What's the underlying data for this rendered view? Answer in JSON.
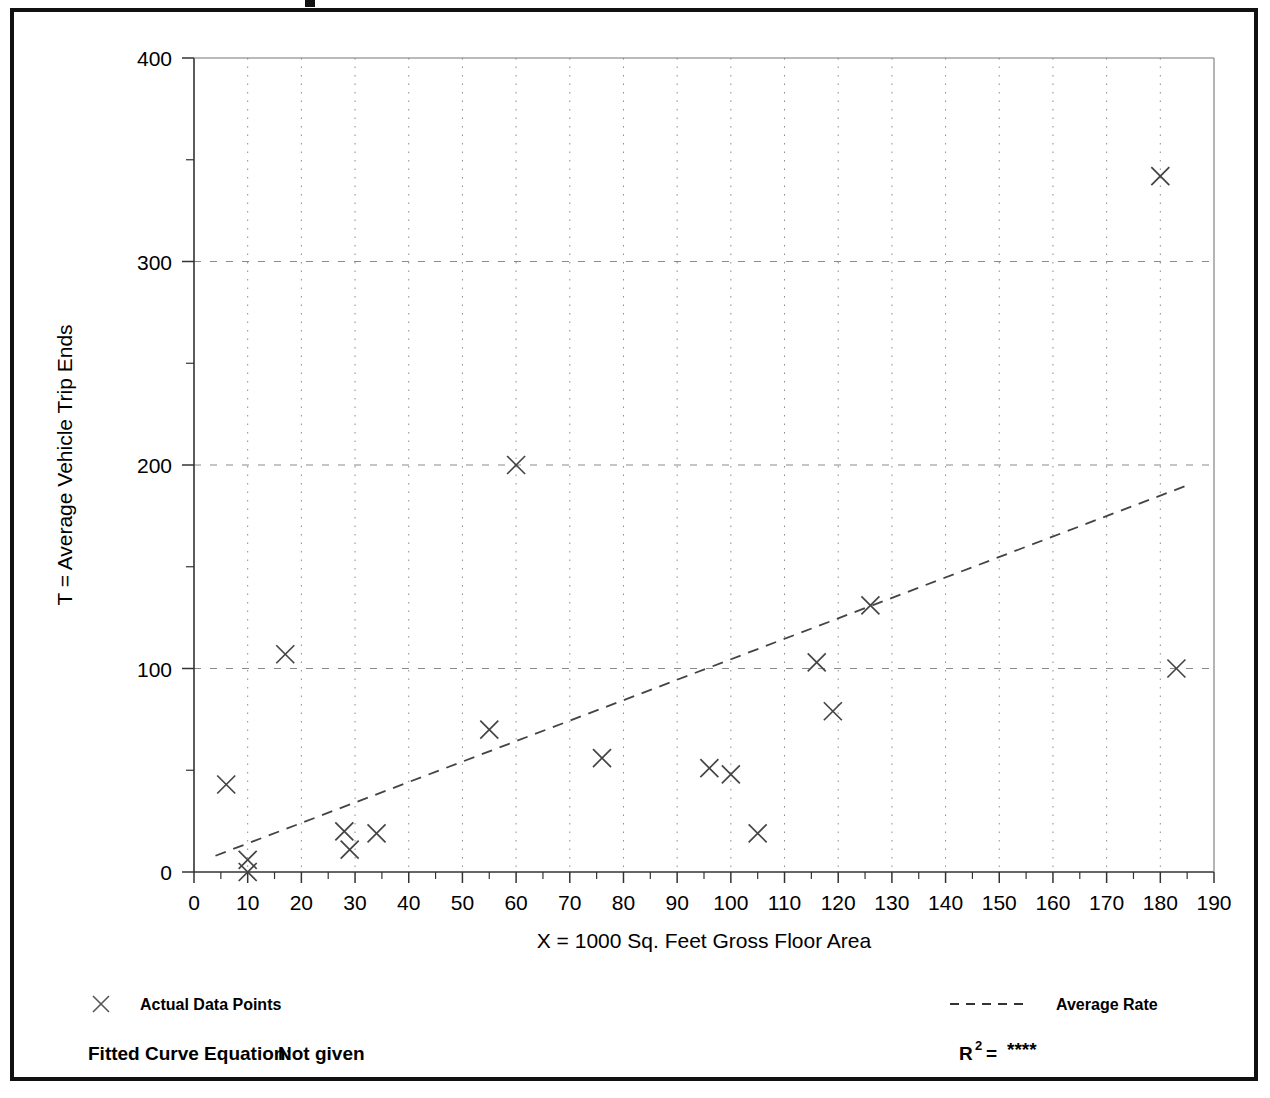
{
  "figure": {
    "frame_border_color": "#111111",
    "background": "#ffffff"
  },
  "axes": {
    "y_title": "T = Average Vehicle Trip Ends",
    "x_title": "X = 1000 Sq. Feet Gross Floor Area",
    "y_ticks": [
      "0",
      "100",
      "200",
      "300",
      "400"
    ],
    "x_ticks": [
      "0",
      "10",
      "20",
      "30",
      "40",
      "50",
      "60",
      "70",
      "80",
      "90",
      "100",
      "110",
      "120",
      "130",
      "140",
      "150",
      "160",
      "170",
      "180",
      "190"
    ]
  },
  "legend": {
    "data_points_label": "Actual Data Points",
    "data_points_marker": "x-marker-icon",
    "average_rate_label": "Average Rate",
    "average_rate_marker": "dashed-line-icon"
  },
  "footer": {
    "fitted_curve_label": "Fitted Curve Equation:",
    "fitted_curve_value": "Not given",
    "r_squared_label": "R",
    "r_squared_exponent": "2",
    "r_squared_equals": "=",
    "r_squared_value": "****"
  },
  "chart_data": {
    "type": "scatter",
    "title": "",
    "xlabel": "X = 1000 Sq. Feet Gross Floor Area",
    "ylabel": "T = Average Vehicle Trip Ends",
    "xlim": [
      0,
      190
    ],
    "ylim": [
      0,
      400
    ],
    "x_major_step": 10,
    "y_major_step": 100,
    "y_minor_step": 50,
    "grid": true,
    "grid_style": "dotted-vertical-and-dashed-horizontal",
    "legend_position": "below-plot",
    "series": [
      {
        "name": "Actual Data Points",
        "type": "scatter",
        "marker": "x",
        "color": "#444444",
        "points": [
          {
            "x": 6,
            "y": 43
          },
          {
            "x": 10,
            "y": 6
          },
          {
            "x": 10,
            "y": 0
          },
          {
            "x": 17,
            "y": 107
          },
          {
            "x": 28,
            "y": 20
          },
          {
            "x": 29,
            "y": 11
          },
          {
            "x": 34,
            "y": 19
          },
          {
            "x": 55,
            "y": 70
          },
          {
            "x": 60,
            "y": 200
          },
          {
            "x": 76,
            "y": 56
          },
          {
            "x": 96,
            "y": 51
          },
          {
            "x": 100,
            "y": 48
          },
          {
            "x": 105,
            "y": 19
          },
          {
            "x": 116,
            "y": 103
          },
          {
            "x": 119,
            "y": 79
          },
          {
            "x": 126,
            "y": 131
          },
          {
            "x": 180,
            "y": 342
          },
          {
            "x": 183,
            "y": 100
          }
        ]
      },
      {
        "name": "Average Rate",
        "type": "line",
        "style": "dashed",
        "color": "#444444",
        "endpoints": [
          {
            "x": 4,
            "y": 8
          },
          {
            "x": 185,
            "y": 190
          }
        ]
      }
    ]
  }
}
